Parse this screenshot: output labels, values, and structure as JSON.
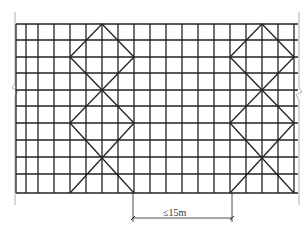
{
  "diagram": {
    "type": "scaffold-elevation-bracing",
    "dimension_label": "≤15m",
    "caption": "",
    "grid": {
      "left": 16,
      "right": 298,
      "top": 24,
      "bottom": 193,
      "columns_x": [
        16,
        26,
        38,
        54,
        70,
        86,
        102,
        118,
        134,
        150,
        166,
        182,
        198,
        214,
        230,
        246,
        262,
        278,
        294
      ],
      "rows_y": [
        24,
        40,
        57,
        73,
        90,
        106,
        123,
        140,
        157,
        174,
        193
      ]
    },
    "bracing": [
      {
        "name": "left-brace-group",
        "center_x": 102,
        "half_width": 32
      },
      {
        "name": "right-brace-group",
        "center_x": 262,
        "half_width": 32
      }
    ],
    "dimension": {
      "x1": 133,
      "x2": 232,
      "y": 218,
      "ext_top": 193
    },
    "colors": {
      "line": "#222222",
      "light_line": "#9a9a9a"
    }
  }
}
